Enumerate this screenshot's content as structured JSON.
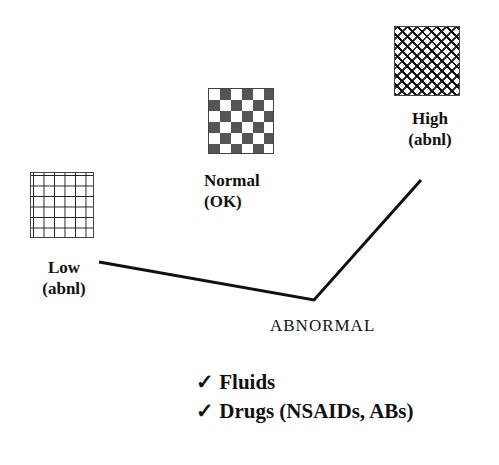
{
  "diagram": {
    "categories": [
      {
        "id": "low",
        "line1": "Low",
        "line2": "(abnl)",
        "pattern": "grid"
      },
      {
        "id": "normal",
        "line1": "Normal",
        "line2": "(OK)",
        "pattern": "checkerboard"
      },
      {
        "id": "high",
        "line1": "High",
        "line2": "(abnl)",
        "pattern": "crosshatch"
      }
    ],
    "abnormal_label": "ABNORMAL",
    "treatments": [
      {
        "check": "✓",
        "label": "Fluids"
      },
      {
        "check": "✓",
        "label": "Drugs (NSAIDs, ABs)"
      }
    ]
  }
}
